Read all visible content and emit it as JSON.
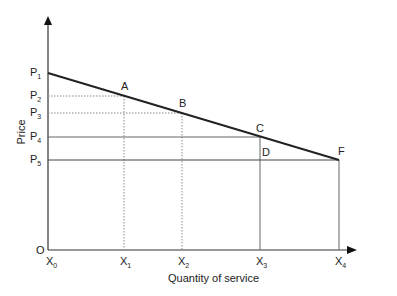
{
  "diagram": {
    "type": "price-quantity demand diagram",
    "y_axis_label": "Price",
    "x_axis_label": "Quantity of service",
    "origin_label": "O",
    "price_levels": [
      {
        "base": "P",
        "sub": "1"
      },
      {
        "base": "P",
        "sub": "2"
      },
      {
        "base": "P",
        "sub": "3"
      },
      {
        "base": "P",
        "sub": "4"
      },
      {
        "base": "P",
        "sub": "5"
      }
    ],
    "quantity_levels": [
      {
        "base": "X",
        "sub": "0"
      },
      {
        "base": "X",
        "sub": "1"
      },
      {
        "base": "X",
        "sub": "2"
      },
      {
        "base": "X",
        "sub": "3"
      },
      {
        "base": "X",
        "sub": "4"
      }
    ],
    "points": [
      {
        "label": "A",
        "at": "X1,P2"
      },
      {
        "label": "B",
        "at": "X2,P3"
      },
      {
        "label": "C",
        "at": "X3,P4"
      },
      {
        "label": "D",
        "at": "X3,P5"
      },
      {
        "label": "F",
        "at": "X4,P5"
      }
    ],
    "colors": {
      "axis": "#333333",
      "demand": "#222222",
      "guide": "#666666",
      "dotted": "#888888"
    }
  }
}
